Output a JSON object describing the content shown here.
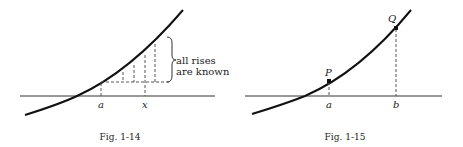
{
  "figures": [
    {
      "id": "fig-1-14",
      "caption": "Fig. 1-14",
      "labels": {
        "a": "a",
        "x": "x"
      },
      "annotation": {
        "line1": "all rises",
        "line2": "are known"
      }
    },
    {
      "id": "fig-1-15",
      "caption": "Fig. 1-15",
      "labels": {
        "a": "a",
        "b": "b",
        "P": "P",
        "Q": "Q"
      }
    }
  ],
  "colors": {
    "ink": "#1a1a1a",
    "dashed": "#555555"
  }
}
